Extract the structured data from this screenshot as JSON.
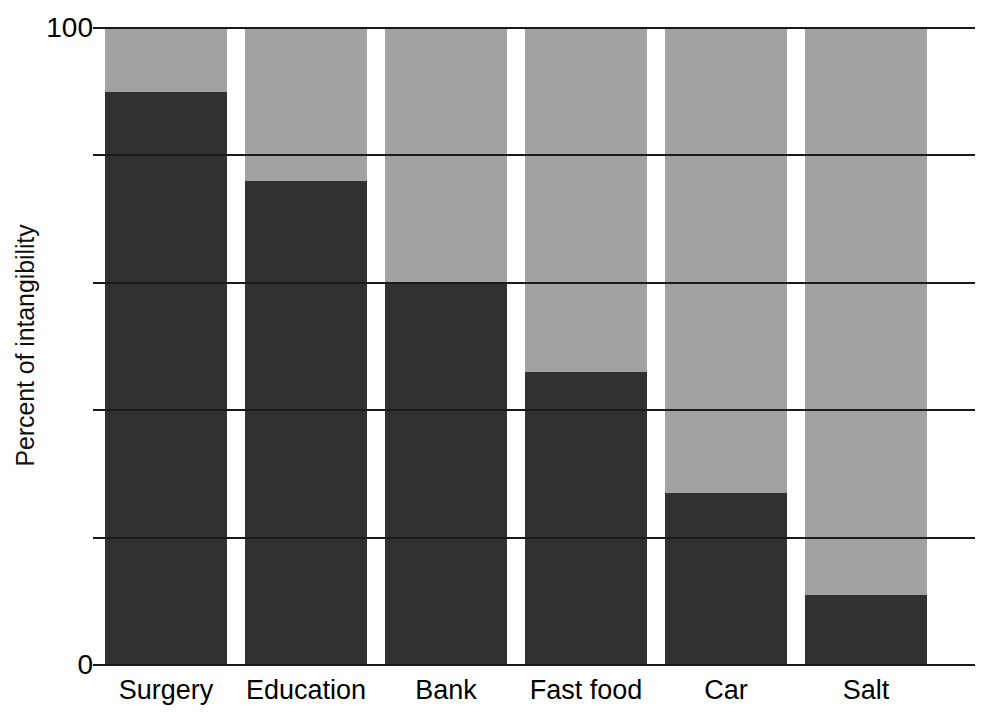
{
  "chart_data": {
    "type": "bar",
    "title": "",
    "subtitle": "",
    "xlabel": "",
    "ylabel": "Percent of intangibility",
    "categories": [
      "Surgery",
      "Education",
      "Bank",
      "Fast food",
      "Car",
      "Salt"
    ],
    "values": [
      90,
      76,
      60,
      46,
      27,
      11
    ],
    "ylim": [
      0,
      100
    ],
    "ytick_values": [
      0,
      20,
      40,
      60,
      80,
      100
    ],
    "ytick_labels": [
      "0",
      "",
      "",
      "",
      "",
      "100"
    ],
    "grid": true,
    "grid_axis": "y",
    "legend": false,
    "legend_position": "none",
    "bar_color": "#313131",
    "column_background_color": "#a2a2a2",
    "plot_background_color": "#ffffff",
    "axis_color": "#1a1a1a",
    "annotations": []
  },
  "axis": {
    "y_title": "Percent of intangibility",
    "y_top_label": "100",
    "y_bottom_label": "0"
  }
}
